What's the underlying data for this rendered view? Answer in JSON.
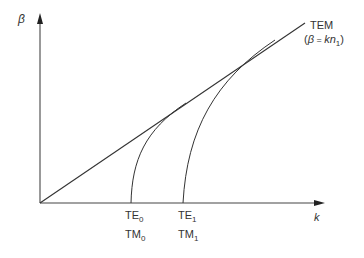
{
  "axes": {
    "y_label": "β",
    "x_label": "k"
  },
  "lines": {
    "tem": {
      "label": "TEM",
      "formula_open": "(",
      "formula_beta": "β",
      "formula_eq": " = ",
      "formula_k": "kn",
      "formula_sub": "1",
      "formula_close": ")"
    }
  },
  "modes": [
    {
      "te": "TE",
      "te_sub": "0",
      "tm": "TM",
      "tm_sub": "0"
    },
    {
      "te": "TE",
      "te_sub": "1",
      "tm": "TM",
      "tm_sub": "1"
    }
  ],
  "colors": {
    "line": "#333333",
    "axis": "#444444",
    "text": "#333333"
  }
}
